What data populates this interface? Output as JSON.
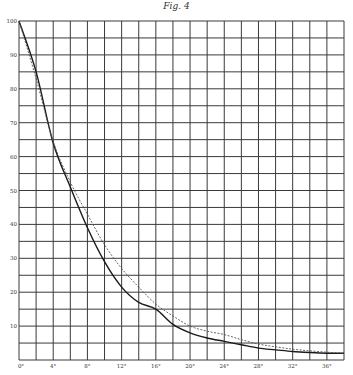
{
  "chart_data": {
    "type": "line",
    "title": "Fig. 4",
    "xlabel": "",
    "ylabel": "",
    "xlim": [
      0,
      38
    ],
    "ylim": [
      0,
      100
    ],
    "grid": true,
    "x_ticks": [
      "0°",
      "4°",
      "8°",
      "12°",
      "16°",
      "20°",
      "24°",
      "28°",
      "32°",
      "36°"
    ],
    "x_tick_values": [
      0,
      4,
      8,
      12,
      16,
      20,
      24,
      28,
      32,
      36
    ],
    "y_ticks": [
      "0",
      "10",
      "20",
      "30",
      "40",
      "50",
      "60",
      "70",
      "80",
      "90",
      "100"
    ],
    "y_tick_values": [
      0,
      10,
      20,
      30,
      40,
      50,
      60,
      70,
      80,
      90,
      100
    ],
    "x_grid_step": 2,
    "y_grid_step": 5,
    "legend": null,
    "x": [
      0,
      2,
      4,
      6,
      8,
      10,
      12,
      14,
      16,
      18,
      20,
      22,
      24,
      26,
      28,
      30,
      32,
      34,
      36,
      38
    ],
    "series": [
      {
        "name": "solid curve",
        "style": "solid",
        "values": [
          100,
          85,
          64,
          51,
          39,
          29,
          21.5,
          17,
          15,
          10.5,
          8,
          6.5,
          5.5,
          4.5,
          3.5,
          3,
          2.5,
          2.2,
          2,
          2
        ]
      },
      {
        "name": "dashed curve",
        "style": "dashed",
        "values": [
          100,
          83,
          64.5,
          52.5,
          43,
          34,
          27,
          21.5,
          16.5,
          13,
          10,
          8.5,
          7.5,
          6,
          4.7,
          3.9,
          3.2,
          2.7,
          2.3,
          2
        ]
      }
    ]
  }
}
